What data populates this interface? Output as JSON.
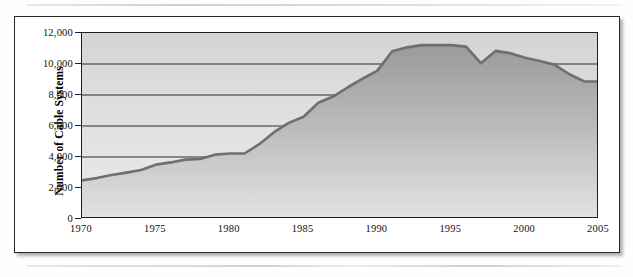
{
  "figure": {
    "frame_border_color": "#262626",
    "plot_bg_top": "#d4d4d2",
    "plot_bg_bottom": "#eaeae8",
    "line_color": "#6b6b6b",
    "gridline_color": "#2a2a2a"
  },
  "chart_data": {
    "type": "area",
    "title": "",
    "xlabel": "",
    "ylabel": "Number of Cable Systems",
    "xlim": [
      1970,
      2005
    ],
    "ylim": [
      0,
      12000
    ],
    "grid": true,
    "legend": null,
    "y_ticks": [
      "0",
      "2,000",
      "4,000",
      "6,000",
      "8,000",
      "10,000",
      "12,000"
    ],
    "y_tick_values": [
      0,
      2000,
      4000,
      6000,
      8000,
      10000,
      12000
    ],
    "x_ticks": [
      "1970",
      "1975",
      "1980",
      "1985",
      "1990",
      "1995",
      "2000",
      "2005"
    ],
    "x_tick_values": [
      1970,
      1975,
      1980,
      1985,
      1990,
      1995,
      2000,
      2005
    ],
    "x": [
      1970,
      1971,
      1972,
      1973,
      1974,
      1975,
      1976,
      1977,
      1978,
      1979,
      1980,
      1981,
      1982,
      1983,
      1984,
      1985,
      1986,
      1987,
      1988,
      1989,
      1990,
      1991,
      1992,
      1993,
      1994,
      1995,
      1996,
      1997,
      1998,
      1999,
      2000,
      2001,
      2002,
      2003,
      2004,
      2005
    ],
    "values": [
      2490,
      2639,
      2841,
      2991,
      3158,
      3506,
      3651,
      3832,
      3875,
      4150,
      4225,
      4225,
      4825,
      5600,
      6200,
      6600,
      7500,
      7900,
      8500,
      9050,
      9575,
      10823,
      11075,
      11217,
      11230,
      11218,
      11119,
      10050,
      10845,
      10700,
      10400,
      10200,
      9947,
      9339,
      8875,
      8875
    ],
    "series": [
      {
        "name": "Number of Cable Systems",
        "values": [
          2490,
          2639,
          2841,
          2991,
          3158,
          3506,
          3651,
          3832,
          3875,
          4150,
          4225,
          4225,
          4825,
          5600,
          6200,
          6600,
          7500,
          7900,
          8500,
          9050,
          9575,
          10823,
          11075,
          11217,
          11230,
          11218,
          11119,
          10050,
          10845,
          10700,
          10400,
          10200,
          9947,
          9339,
          8875,
          8875
        ]
      }
    ],
    "notes": {
      "start_value": 2490,
      "peak_value": 11230,
      "peak_year": 1994,
      "dip_value": 10050,
      "dip_year": 1997,
      "end_value": 8875,
      "end_year": 2005
    }
  }
}
